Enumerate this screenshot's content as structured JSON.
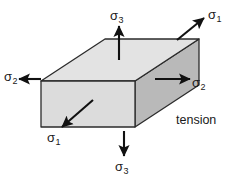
{
  "figure": {
    "caption": "tension",
    "background_color": "#ffffff",
    "outline_color": "#1a1a1a"
  },
  "block": {
    "name": "rectangular-stress-block",
    "top_face_color": "#e3e3e3",
    "front_face_color": "#dcdcdc",
    "right_face_color": "#b9b9b9",
    "edge_color": "#2b2b2b"
  },
  "stress_arrows": [
    {
      "id": "sigma3-top",
      "symbol": "σ",
      "subscript": "3",
      "direction": "up",
      "position": "top-center",
      "sense": "tension"
    },
    {
      "id": "sigma1-top-right",
      "symbol": "σ",
      "subscript": "1",
      "direction": "up-right",
      "position": "top-right",
      "sense": "tension"
    },
    {
      "id": "sigma2-left",
      "symbol": "σ",
      "subscript": "2",
      "direction": "left",
      "position": "mid-left",
      "sense": "tension"
    },
    {
      "id": "sigma2-right",
      "symbol": "σ",
      "subscript": "2",
      "direction": "right",
      "position": "mid-right",
      "sense": "tension"
    },
    {
      "id": "sigma1-bottom-left",
      "symbol": "σ",
      "subscript": "1",
      "direction": "down-left",
      "position": "bottom-left",
      "sense": "tension"
    },
    {
      "id": "sigma3-bottom",
      "symbol": "σ",
      "subscript": "3",
      "direction": "down",
      "position": "bottom-center",
      "sense": "tension"
    }
  ]
}
